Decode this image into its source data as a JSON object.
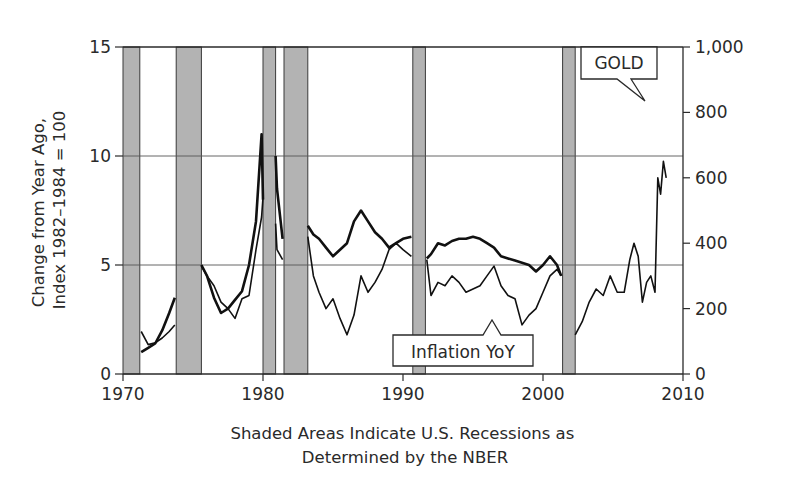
{
  "chart_data": {
    "type": "line",
    "title": "",
    "xlabel": "Shaded Areas Indicate U.S. Recessions as Determined by the NBER",
    "xlabel_lines": [
      "Shaded Areas Indicate U.S. Recessions as",
      "Determined by the NBER"
    ],
    "ylabel_left": "Change from Year Ago, Index 1982–1984 = 100",
    "ylabel_left_lines": [
      "Change from Year Ago,",
      "Index 1982–1984 = 100"
    ],
    "ylabel_right": "",
    "xlim": [
      1970,
      2010
    ],
    "ylim_left": [
      0,
      15
    ],
    "ylim_right": [
      0,
      1000
    ],
    "x_ticks": [
      1970,
      1980,
      1990,
      2000,
      2010
    ],
    "x_tick_labels": [
      "1970",
      "1980",
      "1990",
      "2000",
      "2010"
    ],
    "y_left_ticks": [
      0,
      5,
      10,
      15
    ],
    "y_left_tick_labels": [
      "0",
      "5",
      "10",
      "15"
    ],
    "y_right_ticks": [
      0,
      200,
      400,
      600,
      800,
      1000
    ],
    "y_right_tick_labels": [
      "0",
      "200",
      "400",
      "600",
      "800",
      "1,000"
    ],
    "grid": {
      "horizontal_lines_left_axis": [
        5,
        10
      ]
    },
    "legend": "callouts",
    "annotations": [
      {
        "text": "GOLD",
        "points_to_series": "Gold",
        "position": "top-right"
      },
      {
        "text": "Inflation YoY",
        "points_to_series": "Inflation YoY",
        "position": "bottom-center"
      }
    ],
    "recessions": [
      {
        "start": 1970.0,
        "end": 1971.2
      },
      {
        "start": 1973.8,
        "end": 1975.6
      },
      {
        "start": 1980.0,
        "end": 1980.9
      },
      {
        "start": 1981.5,
        "end": 1983.2
      },
      {
        "start": 1990.7,
        "end": 1991.6
      },
      {
        "start": 2001.4,
        "end": 2002.3
      }
    ],
    "series": [
      {
        "name": "Inflation YoY",
        "axis": "left",
        "x": [
          1971.3,
          1971.8,
          1972.3,
          1972.8,
          1973.3,
          1973.7,
          1975.6,
          1976.0,
          1976.5,
          1977.0,
          1977.5,
          1978.0,
          1978.5,
          1979.0,
          1979.5,
          1979.9,
          1980.0,
          1980.9,
          1981.0,
          1981.4,
          1983.2,
          1983.6,
          1984.0,
          1984.5,
          1985.0,
          1985.5,
          1986.0,
          1986.5,
          1987.0,
          1987.5,
          1988.0,
          1988.5,
          1989.0,
          1989.5,
          1990.0,
          1990.6,
          1991.7,
          1992.0,
          1992.5,
          1993.0,
          1993.5,
          1994.0,
          1994.5,
          1995.0,
          1995.5,
          1996.0,
          1996.5,
          1997.0,
          1997.5,
          1998.0,
          1998.5,
          1999.0,
          1999.5,
          2000.0,
          2000.5,
          2001.0,
          2001.3
        ],
        "values": [
          1.0,
          1.2,
          1.4,
          2.0,
          2.8,
          3.5,
          5.0,
          4.5,
          3.5,
          2.8,
          3.0,
          3.4,
          3.8,
          5.0,
          7.0,
          11.0,
          8.0,
          10.0,
          8.5,
          6.2,
          6.8,
          6.4,
          6.2,
          5.8,
          5.4,
          5.7,
          6.0,
          7.0,
          7.5,
          7.0,
          6.5,
          6.2,
          5.8,
          6.0,
          6.2,
          6.3,
          5.3,
          5.5,
          6.0,
          5.9,
          6.1,
          6.2,
          6.2,
          6.3,
          6.2,
          6.0,
          5.8,
          5.4,
          5.3,
          5.2,
          5.1,
          5.0,
          4.7,
          5.0,
          5.4,
          5.0,
          4.5
        ]
      },
      {
        "name": "Gold",
        "axis": "right",
        "x": [
          1971.3,
          1971.8,
          1972.3,
          1972.8,
          1973.3,
          1973.7,
          1975.6,
          1976.0,
          1976.5,
          1977.0,
          1977.5,
          1978.0,
          1978.5,
          1979.0,
          1979.5,
          1979.9,
          1980.0,
          1980.9,
          1981.0,
          1981.4,
          1983.2,
          1983.6,
          1984.0,
          1984.5,
          1985.0,
          1985.5,
          1986.0,
          1986.5,
          1987.0,
          1987.5,
          1988.0,
          1988.5,
          1989.0,
          1989.5,
          1990.0,
          1990.6,
          1991.7,
          1992.0,
          1992.5,
          1993.0,
          1993.5,
          1994.0,
          1994.5,
          1995.0,
          1995.5,
          1996.0,
          1996.5,
          1997.0,
          1997.5,
          1998.0,
          1998.5,
          1999.0,
          1999.5,
          2000.0,
          2000.5,
          2001.0,
          2001.3,
          2002.3,
          2002.8,
          2003.3,
          2003.8,
          2004.3,
          2004.8,
          2005.3,
          2005.8,
          2006.2,
          2006.5,
          2006.8,
          2007.1,
          2007.4,
          2007.7,
          2008.0,
          2008.2,
          2008.4,
          2008.6,
          2008.8
        ],
        "values": [
          130,
          90,
          95,
          110,
          130,
          150,
          330,
          300,
          270,
          220,
          200,
          170,
          230,
          240,
          380,
          480,
          540,
          460,
          380,
          350,
          420,
          300,
          250,
          200,
          230,
          170,
          120,
          180,
          300,
          250,
          280,
          320,
          380,
          400,
          380,
          360,
          350,
          240,
          280,
          270,
          300,
          280,
          250,
          260,
          270,
          300,
          330,
          270,
          240,
          230,
          150,
          180,
          200,
          250,
          300,
          320,
          300,
          120,
          160,
          220,
          260,
          240,
          300,
          250,
          250,
          350,
          400,
          360,
          220,
          280,
          300,
          250,
          600,
          550,
          650,
          600
        ]
      }
    ]
  },
  "page": {
    "gold_callout": "GOLD",
    "inflation_callout": "Inflation YoY"
  }
}
